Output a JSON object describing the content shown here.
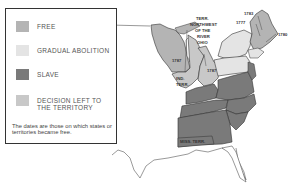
{
  "legend": {
    "items": [
      {
        "label": "FREE",
        "color": "#b4b4b4"
      },
      {
        "label": "GRADUAL ABOLITION",
        "color": "#e4e4e4"
      },
      {
        "label": "SLAVE",
        "color": "#7a7a7a"
      },
      {
        "label": "DECISION LEFT TO THE TERRITORY",
        "color": "#c8c8c8"
      }
    ],
    "note": "The dates are those on which states or territories became free."
  },
  "map": {
    "labels": {
      "northwest_territory": [
        "TERR.",
        "NORTHWEST",
        "OF THE",
        "RIVER",
        "OHIO"
      ],
      "indiana_territory": [
        "IND.",
        "TERR."
      ],
      "mississippi_territory": "MISS. TERR.",
      "date_wisconsin": "1787",
      "date_ohio": "1787",
      "date_nh": "1783",
      "date_vt": "1777",
      "date_ma": "1780"
    },
    "colors": {
      "free": "#b4b4b4",
      "gradual": "#e4e4e4",
      "slave": "#7a7a7a",
      "territory": "#c8c8c8",
      "border": "#333333"
    }
  }
}
